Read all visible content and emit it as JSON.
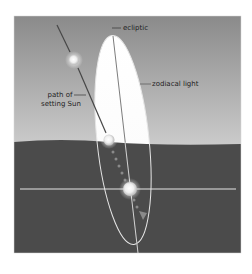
{
  "diagram": {
    "title": "",
    "labels": {
      "ecliptic": "ecliptic",
      "zodiacal_light": "zodiacal light",
      "path_line1": "path of",
      "path_line2": "setting Sun"
    },
    "colors": {
      "background": "#ffffff",
      "sky_top": "#8a8a8a",
      "sky_bottom": "#c9c9c9",
      "ground": "#4b4b4b",
      "zodiacal_light": "#ffffff",
      "lines": "#f2f2f2",
      "sun_path_line": "#4a4a4a",
      "text": "#1e1e1e"
    },
    "elements": [
      {
        "id": "sky",
        "type": "panel"
      },
      {
        "id": "ground",
        "type": "panel"
      },
      {
        "id": "horizon",
        "type": "line"
      },
      {
        "id": "zodiacal-light",
        "type": "ellipse"
      },
      {
        "id": "ecliptic",
        "type": "line"
      },
      {
        "id": "sun-path",
        "type": "line"
      },
      {
        "id": "sun-positions",
        "type": "circles",
        "count": 3
      },
      {
        "id": "direction-arrow",
        "type": "arrow"
      }
    ]
  }
}
